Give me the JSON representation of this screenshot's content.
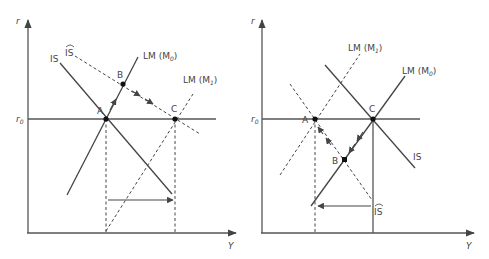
{
  "panels": [
    {
      "id": "left",
      "y_axis_label": "r",
      "x_axis_label": "Y",
      "r0_label": "r",
      "r0_sub": "0",
      "curves": {
        "is": "IS",
        "is_hat": "IS",
        "lm_m0_prefix": "LM (M",
        "lm_m0_sub": "0",
        "lm_m1_prefix": "LM (M",
        "lm_m1_sub": "1",
        "close": ")"
      },
      "points": {
        "a": "A",
        "b": "B",
        "c": "C"
      }
    },
    {
      "id": "right",
      "y_axis_label": "r",
      "x_axis_label": "Y",
      "r0_label": "r",
      "r0_sub": "0",
      "curves": {
        "is": "IS",
        "is_hat": "IS",
        "lm_m0_prefix": "LM (M",
        "lm_m0_sub": "0",
        "lm_m1_prefix": "LM (M",
        "lm_m1_sub": "1",
        "close": ")"
      },
      "points": {
        "a": "A",
        "b": "B",
        "c": "C"
      }
    }
  ]
}
